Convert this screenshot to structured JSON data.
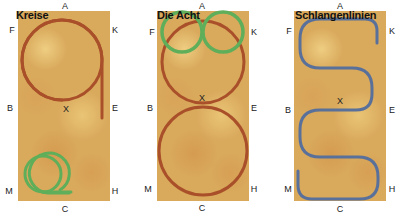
{
  "colors": {
    "arena_sand": "#d9a95c",
    "track_brown": "#a9502a",
    "track_green": "#5fae5a",
    "track_blue": "#59709a",
    "label_text": "#222222"
  },
  "panels": [
    {
      "title": "Kreise",
      "letters": {
        "top": "A",
        "top_left": "F",
        "top_right": "K",
        "mid_left": "B",
        "center": "X",
        "mid_right": "E",
        "bottom_left": "M",
        "bottom_right": "H",
        "bottom": "C"
      },
      "figures": [
        {
          "shape": "large circle with tail to E",
          "color": "brown"
        },
        {
          "shape": "small circle with tail to C",
          "color": "green"
        }
      ]
    },
    {
      "title": "Die Acht",
      "letters": {
        "top": "A",
        "top_left": "F",
        "top_right": "K",
        "mid_left": "B",
        "center": "X",
        "mid_right": "E",
        "bottom_left": "M",
        "bottom_right": "H",
        "bottom": "C"
      },
      "figures": [
        {
          "shape": "large figure eight through X",
          "color": "brown"
        },
        {
          "shape": "small figure eight at top",
          "color": "green"
        }
      ]
    },
    {
      "title": "Schlangenlinien",
      "letters": {
        "top": "A",
        "top_left": "F",
        "top_right": "K",
        "mid_left": "B",
        "center": "X",
        "mid_right": "E",
        "bottom_left": "M",
        "bottom_right": "H",
        "bottom": "C"
      },
      "figures": [
        {
          "shape": "serpentine with four loops",
          "color": "blue"
        }
      ]
    }
  ]
}
